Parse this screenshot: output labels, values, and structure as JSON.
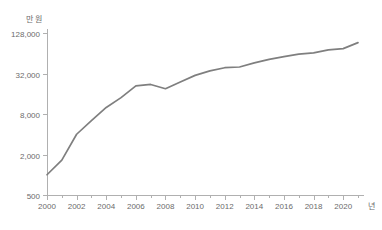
{
  "chart_data": {
    "type": "line",
    "title": "",
    "xlabel": "년",
    "ylabel": "만 원",
    "yscale": "log",
    "ylim": [
      500,
      128000
    ],
    "xlim": [
      2000,
      2021
    ],
    "grid": false,
    "legend": "none",
    "y_ticks": [
      "500",
      "2,000",
      "8,000",
      "32,000",
      "128,000"
    ],
    "y_tick_values": [
      500,
      2000,
      8000,
      32000,
      128000
    ],
    "x_ticks": [
      "2000",
      "2002",
      "2004",
      "2006",
      "2008",
      "2010",
      "2012",
      "2014",
      "2016",
      "2018",
      "2020"
    ],
    "x_tick_values": [
      2000,
      2002,
      2004,
      2006,
      2008,
      2010,
      2012,
      2014,
      2016,
      2018,
      2020
    ],
    "x": [
      2000,
      2001,
      2002,
      2003,
      2004,
      2005,
      2006,
      2007,
      2008,
      2009,
      2010,
      2011,
      2012,
      2013,
      2014,
      2015,
      2016,
      2017,
      2018,
      2019,
      2020,
      2021
    ],
    "values": [
      1000,
      1650,
      4000,
      6400,
      10000,
      14000,
      21000,
      22000,
      19000,
      24000,
      30000,
      35000,
      39000,
      40000,
      46000,
      52000,
      57000,
      62000,
      65000,
      72000,
      75000,
      92000
    ],
    "series": [
      {
        "name": "series-1",
        "color": "#7f7f7f",
        "values": [
          1000,
          1650,
          4000,
          6400,
          10000,
          14000,
          21000,
          22000,
          19000,
          24000,
          30000,
          35000,
          39000,
          40000,
          46000,
          52000,
          57000,
          62000,
          65000,
          72000,
          75000,
          92000
        ]
      }
    ],
    "annotations": []
  },
  "axis": {
    "unit_label_y": "만 원",
    "unit_label_x": "년"
  },
  "colors": {
    "line": "#7f7f7f",
    "axis": "#b0b0b0",
    "text": "#6b6b6b",
    "background": "#ffffff"
  }
}
